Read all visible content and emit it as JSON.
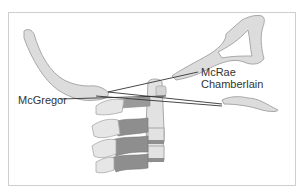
{
  "diagram": {
    "labels": {
      "mcrae": "McRae",
      "chamberlain": "Chamberlain",
      "mcgregor": "McGregor"
    },
    "colors": {
      "bone_light": "#dcdcdc",
      "bone_stroke": "#a8a8a8",
      "disc_dark": "#8e8e8e",
      "line": "#333333",
      "border": "#cfcfcf"
    }
  }
}
